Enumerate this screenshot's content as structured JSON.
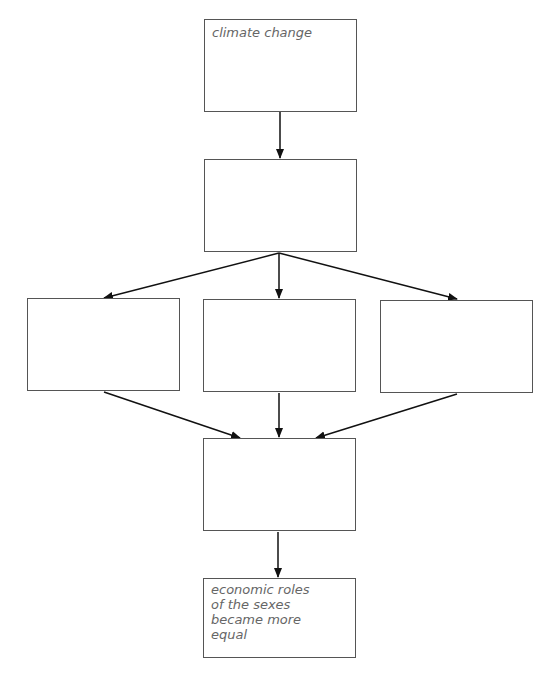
{
  "diagram": {
    "type": "flowchart",
    "nodes": [
      {
        "id": "top",
        "text": "climate change",
        "x": 204,
        "y": 19,
        "w": 153,
        "h": 93
      },
      {
        "id": "second",
        "text": "",
        "x": 204,
        "y": 159,
        "w": 153,
        "h": 93
      },
      {
        "id": "left",
        "text": "",
        "x": 27,
        "y": 298,
        "w": 153,
        "h": 93
      },
      {
        "id": "middle",
        "text": "",
        "x": 203,
        "y": 299,
        "w": 153,
        "h": 93
      },
      {
        "id": "right",
        "text": "",
        "x": 380,
        "y": 300,
        "w": 153,
        "h": 93
      },
      {
        "id": "fourth",
        "text": "",
        "x": 203,
        "y": 438,
        "w": 153,
        "h": 93
      },
      {
        "id": "bottom",
        "text": "economic roles of the sexes became more equal",
        "x": 203,
        "y": 578,
        "w": 153,
        "h": 80
      }
    ],
    "edges": [
      [
        "top",
        "second"
      ],
      [
        "second",
        "left"
      ],
      [
        "second",
        "middle"
      ],
      [
        "second",
        "right"
      ],
      [
        "left",
        "fourth"
      ],
      [
        "middle",
        "fourth"
      ],
      [
        "right",
        "fourth"
      ],
      [
        "fourth",
        "bottom"
      ]
    ]
  },
  "labels": {
    "top": "climate change",
    "bottom_lines": [
      "economic roles",
      "of the sexes",
      "became more",
      "equal"
    ]
  }
}
